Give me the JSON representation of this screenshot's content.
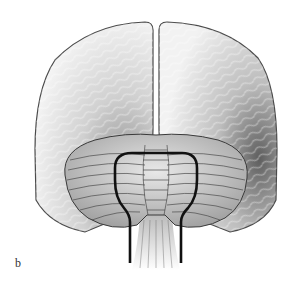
{
  "figure": {
    "panel_label": "b",
    "colors": {
      "background": "#ffffff",
      "outline": "#4a4a4a",
      "shade_dark": "#6e6e6e",
      "shade_light": "#f2f2f2",
      "bold_loop": "#111111"
    }
  }
}
